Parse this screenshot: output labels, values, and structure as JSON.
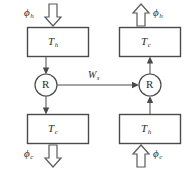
{
  "diagram": {
    "type": "thermodynamic-cycle-block-diagram",
    "boxes": [
      {
        "id": "top-left",
        "symbol": "T",
        "subscript": "h",
        "x": 27,
        "y": 27,
        "w": 61,
        "h": 29
      },
      {
        "id": "bottom-left",
        "symbol": "T",
        "subscript": "c",
        "x": 27,
        "y": 114,
        "w": 61,
        "h": 29
      },
      {
        "id": "top-right",
        "symbol": "T",
        "subscript": "c",
        "x": 119,
        "y": 27,
        "w": 61,
        "h": 29
      },
      {
        "id": "bottom-right",
        "symbol": "T",
        "subscript": "h",
        "x": 119,
        "y": 114,
        "w": 61,
        "h": 29
      }
    ],
    "nodes": [
      {
        "id": "left-engine",
        "symbol": "R",
        "cx": 46,
        "cy": 85,
        "r": 11
      },
      {
        "id": "right-engine",
        "symbol": "R",
        "cx": 150,
        "cy": 85,
        "r": 11
      }
    ],
    "work_link": {
      "symbol": "W",
      "subscript": "s",
      "from": "left-engine",
      "to": "right-engine",
      "direction": "left-to-right"
    },
    "fluxes": [
      {
        "id": "flux-top-left",
        "symbol": "ϕ",
        "subscript": "h",
        "direction": "down",
        "flow": "into-box",
        "label_side": "left"
      },
      {
        "id": "flux-bottom-left",
        "symbol": "ϕ",
        "subscript": "c",
        "direction": "down",
        "flow": "out-of-box",
        "label_side": "left"
      },
      {
        "id": "flux-top-right",
        "symbol": "ϕ",
        "subscript": "h",
        "direction": "up",
        "flow": "out-of-box",
        "label_side": "right"
      },
      {
        "id": "flux-bottom-right",
        "symbol": "ϕ",
        "subscript": "c",
        "direction": "up",
        "flow": "into-box",
        "label_side": "right"
      }
    ],
    "colors": {
      "stroke": "#4a4a4a",
      "block_arrow_stroke": "#5a5a5a",
      "background": "#ffffff",
      "text": "#2b2b2b"
    }
  }
}
